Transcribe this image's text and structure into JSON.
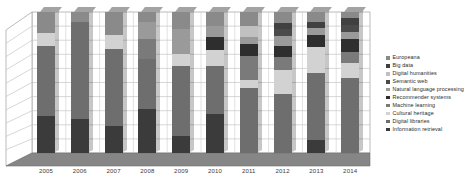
{
  "chart_data": {
    "type": "bar",
    "subtype": "stacked-3d-column-percent",
    "title": "",
    "xlabel": "",
    "ylabel": "",
    "ylim": [
      0,
      100
    ],
    "grid": true,
    "gridlines": 10,
    "legend_position": "right",
    "categories": [
      "2005",
      "2006",
      "2007",
      "2008",
      "2009",
      "2010",
      "2011",
      "2012",
      "2013",
      "2014"
    ],
    "series": [
      {
        "name": "Information retrieval",
        "color": "#3b3b3b",
        "values": [
          26,
          24,
          19,
          31,
          12,
          28,
          0,
          0,
          9,
          0
        ]
      },
      {
        "name": "Digital libraries",
        "color": "#6e6e6e",
        "values": [
          50,
          69,
          55,
          36,
          50,
          34,
          46,
          42,
          48,
          53
        ]
      },
      {
        "name": "Cultural heritage",
        "color": "#d2d2d2",
        "values": [
          9,
          0,
          10,
          0,
          8,
          11,
          6,
          17,
          18,
          11
        ]
      },
      {
        "name": "Machine learning",
        "color": "#7a7a7a",
        "values": [
          0,
          0,
          0,
          14,
          0,
          0,
          17,
          9,
          0,
          8
        ]
      },
      {
        "name": "Recommender systems",
        "color": "#2e2e2e",
        "values": [
          0,
          0,
          0,
          0,
          0,
          9,
          8,
          8,
          9,
          9
        ]
      },
      {
        "name": "Natural language processing",
        "color": "#9a9a9a",
        "values": [
          0,
          0,
          0,
          12,
          18,
          8,
          5,
          7,
          5,
          5
        ]
      },
      {
        "name": "Semantic web",
        "color": "#4a4a4a",
        "values": [
          0,
          0,
          0,
          0,
          0,
          0,
          0,
          5,
          0,
          5
        ]
      },
      {
        "name": "Digital humanities",
        "color": "#c0c0c0",
        "values": [
          0,
          0,
          0,
          0,
          0,
          0,
          8,
          0,
          0,
          0
        ]
      },
      {
        "name": "Big data",
        "color": "#404040",
        "values": [
          0,
          0,
          0,
          0,
          0,
          0,
          0,
          4,
          4,
          5
        ]
      },
      {
        "name": "Europeana",
        "color": "#8a8a8a",
        "values": [
          15,
          7,
          16,
          7,
          12,
          10,
          10,
          8,
          7,
          4
        ]
      }
    ]
  },
  "legend": {
    "items": [
      {
        "label": "Europeana",
        "color": "#8a8a8a"
      },
      {
        "label": "Big data",
        "color": "#404040"
      },
      {
        "label": "Digital humanities",
        "color": "#c0c0c0"
      },
      {
        "label": "Semantic web",
        "color": "#4a4a4a"
      },
      {
        "label": "Natural language processing",
        "color": "#9a9a9a"
      },
      {
        "label": "Recommender systems",
        "color": "#2e2e2e"
      },
      {
        "label": "Machine learning",
        "color": "#7a7a7a"
      },
      {
        "label": "Cultural heritage",
        "color": "#d2d2d2"
      },
      {
        "label": "Digital libraries",
        "color": "#6e6e6e"
      },
      {
        "label": "Information retrieval",
        "color": "#3b3b3b"
      }
    ]
  },
  "axis": {
    "x_tick_labels": [
      "2005",
      "2006",
      "2007",
      "2008",
      "2009",
      "2010",
      "2011",
      "2012",
      "2013",
      "2014"
    ]
  },
  "style": {
    "background": "#ffffff",
    "grid_color": "#b9b9b9",
    "frame_color": "#9d9d9d",
    "floor_color": "#7c7c7c"
  }
}
